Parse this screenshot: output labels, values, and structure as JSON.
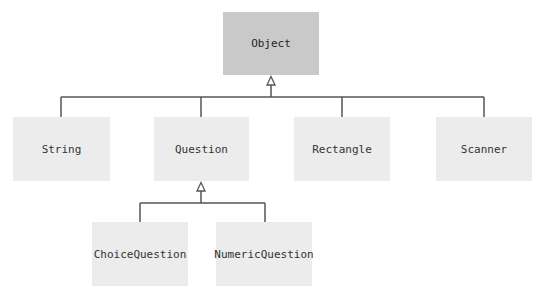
{
  "diagram": {
    "type": "class-inheritance-hierarchy",
    "nodes": {
      "object": {
        "label": "Object",
        "x": 223,
        "y": 12,
        "w": 96,
        "h": 63
      },
      "string": {
        "label": "String",
        "x": 13,
        "y": 117,
        "w": 97,
        "h": 64
      },
      "question": {
        "label": "Question",
        "x": 154,
        "y": 117,
        "w": 95,
        "h": 64
      },
      "rectangle": {
        "label": "Rectangle",
        "x": 294,
        "y": 117,
        "w": 96,
        "h": 64
      },
      "scanner": {
        "label": "Scanner",
        "x": 436,
        "y": 117,
        "w": 96,
        "h": 64
      },
      "choice_question": {
        "label": "ChoiceQuestion",
        "x": 92,
        "y": 222,
        "w": 96,
        "h": 64
      },
      "numeric_question": {
        "label": "NumericQuestion",
        "x": 216,
        "y": 222,
        "w": 96,
        "h": 64
      }
    },
    "edges": [
      {
        "from": "String",
        "to": "Object",
        "kind": "inheritance"
      },
      {
        "from": "Question",
        "to": "Object",
        "kind": "inheritance"
      },
      {
        "from": "Rectangle",
        "to": "Object",
        "kind": "inheritance"
      },
      {
        "from": "Scanner",
        "to": "Object",
        "kind": "inheritance"
      },
      {
        "from": "ChoiceQuestion",
        "to": "Question",
        "kind": "inheritance"
      },
      {
        "from": "NumericQuestion",
        "to": "Question",
        "kind": "inheritance"
      }
    ],
    "colors": {
      "root_fill": "#c9c9c9",
      "node_fill": "#ececec",
      "line": "#555555",
      "text": "#333333"
    }
  }
}
